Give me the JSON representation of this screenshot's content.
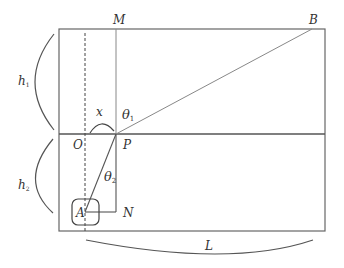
{
  "diagram": {
    "labels": {
      "M": "M",
      "B": "B",
      "O": "O",
      "P": "P",
      "A": "A",
      "N": "N",
      "x": "x",
      "theta1": "θ",
      "theta1_sub": "1",
      "theta2": "θ",
      "theta2_sub": "2",
      "h1": "h",
      "h1_sub": "1",
      "h2": "h",
      "h2_sub": "2",
      "L": "L"
    },
    "colors": {
      "line": "#555555",
      "thin_line": "#888888",
      "text": "#333333"
    }
  }
}
